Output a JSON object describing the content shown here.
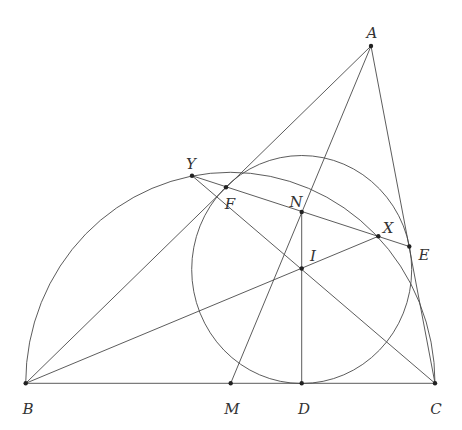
{
  "diagram": {
    "type": "geometry-figure",
    "colors": {
      "stroke": "#4a4a4a",
      "point": "#222222",
      "label": "#333333",
      "background": "#ffffff"
    },
    "points": [
      {
        "name": "A",
        "x": 371,
        "y": 46,
        "label": "A",
        "lx": 372,
        "ly": 34
      },
      {
        "name": "B",
        "x": 25.7,
        "y": 383.3,
        "label": "B",
        "lx": 28,
        "ly": 410
      },
      {
        "name": "C",
        "x": 435,
        "y": 383.3,
        "label": "C",
        "lx": 436,
        "ly": 410
      },
      {
        "name": "M",
        "x": 230.7,
        "y": 383.3,
        "label": "M",
        "lx": 232,
        "ly": 410
      },
      {
        "name": "D",
        "x": 301.7,
        "y": 383.3,
        "label": "D",
        "lx": 304,
        "ly": 410
      },
      {
        "name": "I",
        "x": 301.7,
        "y": 268.5,
        "label": "I",
        "lx": 313,
        "ly": 257
      },
      {
        "name": "N",
        "x": 301.7,
        "y": 212,
        "label": "N",
        "lx": 296,
        "ly": 203
      },
      {
        "name": "X",
        "x": 378.3,
        "y": 236.3,
        "label": "X",
        "lx": 388,
        "ly": 229
      },
      {
        "name": "E",
        "x": 409.3,
        "y": 246.5,
        "label": "E",
        "lx": 424,
        "ly": 256
      },
      {
        "name": "F",
        "x": 226,
        "y": 187.3,
        "label": "F",
        "lx": 230,
        "ly": 205
      },
      {
        "name": "Y",
        "x": 192,
        "y": 175.7,
        "label": "Y",
        "lx": 191,
        "ly": 165
      }
    ],
    "segments": [
      [
        "B",
        "C"
      ],
      [
        "A",
        "B"
      ],
      [
        "A",
        "C"
      ],
      [
        "A",
        "M"
      ],
      [
        "Y",
        "E"
      ],
      [
        "Y",
        "C"
      ],
      [
        "B",
        "X"
      ],
      [
        "N",
        "D"
      ]
    ],
    "circles": [
      {
        "name": "incircle",
        "cx": 301.7,
        "cy": 269.5,
        "rx": 110,
        "ry": 114
      },
      {
        "name": "semicircle-BC",
        "cx": 230.35,
        "cy": 383.3,
        "rx": 204.65,
        "ry": 211
      }
    ]
  }
}
